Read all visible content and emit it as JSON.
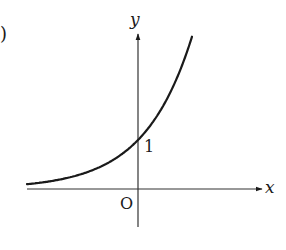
{
  "figure": {
    "partial_label": ")",
    "x_axis_label": "x",
    "y_axis_label": "y",
    "origin_label": "O",
    "y_intercept_label": "1",
    "curve": "exponential-growth",
    "colors": {
      "ink": "#1a1a1a",
      "axis": "#333333",
      "background": "#ffffff"
    }
  },
  "geometry": {
    "origin_px": [
      138,
      189
    ],
    "unit_x_px": 33,
    "unit_y_px": 49,
    "base": 2,
    "x_start_px": 27,
    "x_end_px": 192
  }
}
